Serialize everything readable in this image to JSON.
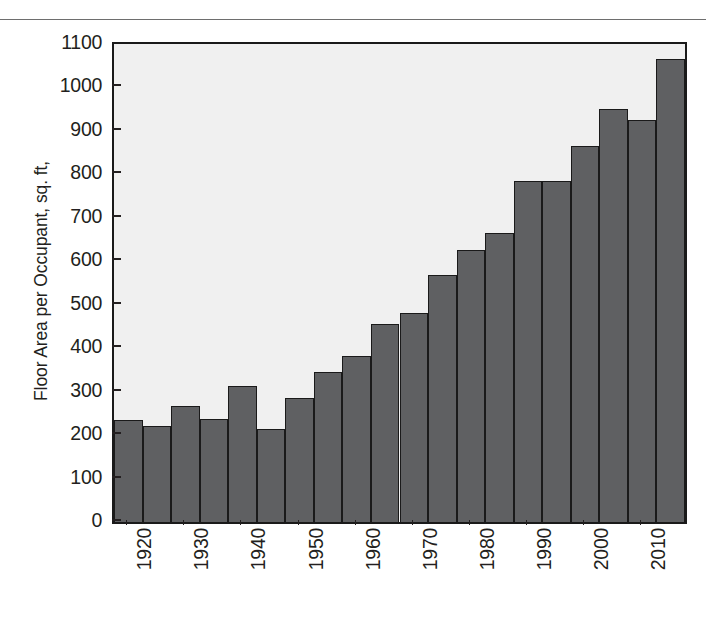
{
  "figure": {
    "has_top_rule": true,
    "background_color": "#ffffff",
    "plot_background_color": "#f0f0f0",
    "bar_fill_color": "#5f6062",
    "bar_edge_color": "#1a1a1a",
    "text_color": "#231f20"
  },
  "chart_data": {
    "type": "bar",
    "title": "",
    "xlabel": "",
    "ylabel": "Floor Area per Occupant, sq. ft,",
    "ylim": [
      0,
      1100
    ],
    "yticks": [
      0,
      100,
      200,
      300,
      400,
      500,
      600,
      700,
      800,
      900,
      1000,
      1100
    ],
    "ytick_labels": [
      "0",
      "100",
      "200",
      "300",
      "400",
      "500",
      "600",
      "700",
      "800",
      "900",
      "1000",
      "1100"
    ],
    "grid": false,
    "legend": null,
    "xtick_labels": [
      "1920",
      "1930",
      "1940",
      "1950",
      "1960",
      "1970",
      "1980",
      "1990",
      "2000",
      "2010"
    ],
    "xtick_label_rotation": 90,
    "categories": [
      "1920",
      "1925",
      "1930",
      "1935",
      "1940",
      "1925",
      "1950",
      "1955",
      "1960",
      "1965",
      "1970",
      "1975",
      "1980",
      "1985",
      "1990",
      "1995",
      "2000",
      "2005",
      "2010",
      "2015"
    ],
    "x": [
      1920,
      1925,
      1930,
      1935,
      1940,
      1945,
      1950,
      1955,
      1960,
      1965,
      1970,
      1975,
      1980,
      1985,
      1990,
      1995,
      2000,
      2005,
      2010,
      2015
    ],
    "values": [
      235,
      220,
      268,
      238,
      313,
      213,
      285,
      345,
      383,
      455,
      480,
      568,
      625,
      665,
      785,
      785,
      865,
      950,
      925,
      1065
    ],
    "bar_count": 20,
    "bar_interval_years": 5
  }
}
